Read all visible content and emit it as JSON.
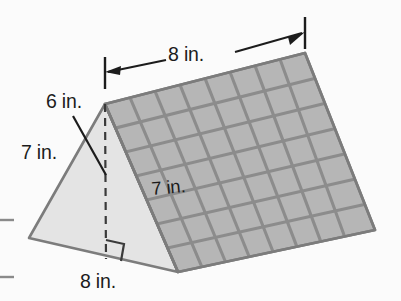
{
  "figure": {
    "shape": "triangular-prism",
    "background_color": "#fbfbfb",
    "labels": {
      "top_length": "8 in.",
      "triangle_height": "6 in.",
      "triangle_slant": "7 in.",
      "prism_depth": "7 in.",
      "base_width": "8 in."
    },
    "colors": {
      "grid_face_fill": "#b6b6b6",
      "grid_line": "#8c8c8c",
      "triangle_face_fill": "#e4e4e4",
      "outline": "#7c7c7c",
      "label_text": "#1c1c1c",
      "dimension_line": "#1c1c1c",
      "crop_mark": "#8a8a8a"
    },
    "grid": {
      "columns": 8,
      "rows": 7
    },
    "annotations": {
      "right_angle_marker": "right-angle",
      "height_line_style": "dashed",
      "leader_line_from": "6 in.",
      "dimension_arrows": 2,
      "crop_marks": 2
    }
  }
}
